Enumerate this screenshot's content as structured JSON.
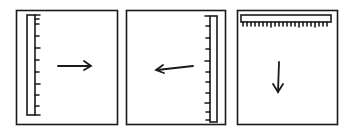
{
  "figure": {
    "panels": [
      {
        "id": "panel-1",
        "ruler_position": "left",
        "ruler_orientation": "vertical",
        "arrow_direction": "right"
      },
      {
        "id": "panel-2",
        "ruler_position": "right",
        "ruler_orientation": "vertical",
        "arrow_direction": "left"
      },
      {
        "id": "panel-3",
        "ruler_position": "top",
        "ruler_orientation": "horizontal",
        "arrow_direction": "down"
      }
    ],
    "colors": {
      "ink": "#1a1a1a",
      "background": "#ffffff"
    }
  }
}
